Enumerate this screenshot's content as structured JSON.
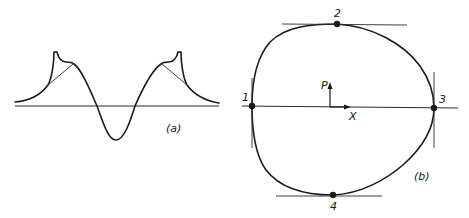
{
  "figure": {
    "panel_a": {
      "label": "(a)",
      "description": "Symmetric waveform with two cusped peaks and a central negative trough, with tangent construction lines at each peak"
    },
    "panel_b": {
      "label": "(b)",
      "description": "Closed egg-shaped curve with four marked tangent points",
      "points": [
        {
          "id": "1",
          "label": "1"
        },
        {
          "id": "2",
          "label": "2"
        },
        {
          "id": "3",
          "label": "3"
        },
        {
          "id": "4",
          "label": "4"
        }
      ],
      "axes": {
        "vertical_label": "P",
        "horizontal_label": "X"
      }
    }
  },
  "colors": {
    "ink": "#1a1a1a",
    "background": "#ffffff"
  }
}
